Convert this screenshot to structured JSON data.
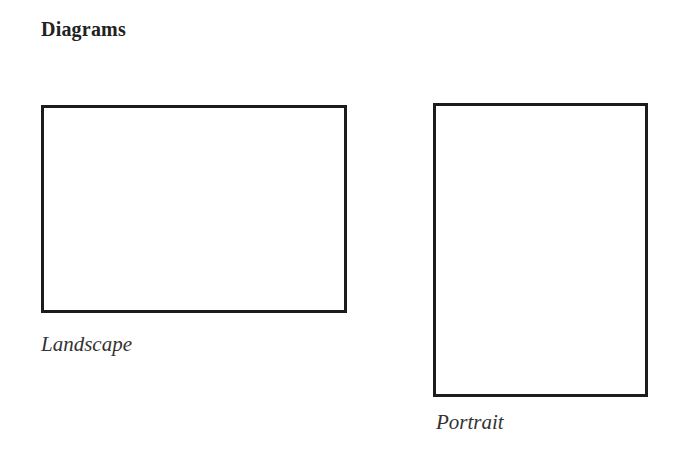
{
  "heading": "Diagrams",
  "diagrams": [
    {
      "id": "landscape",
      "shape": "rectangle",
      "orientation": "landscape",
      "label": "Landscape"
    },
    {
      "id": "portrait",
      "shape": "rectangle",
      "orientation": "portrait",
      "label": "Portrait"
    }
  ],
  "colors": {
    "stroke": "#1c1c1c",
    "background": "#ffffff",
    "text": "#333333"
  }
}
